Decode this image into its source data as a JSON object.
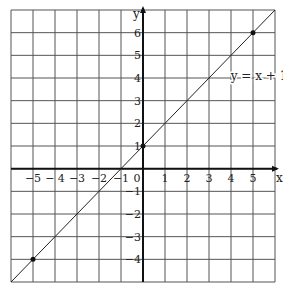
{
  "chart_data": {
    "type": "line",
    "title": "",
    "xlabel": "x",
    "ylabel": "y",
    "xlim": [
      -6,
      6
    ],
    "ylim": [
      -5,
      7
    ],
    "grid": true,
    "x_ticks": [
      -5,
      -4,
      -3,
      -2,
      -1,
      0,
      1,
      2,
      3,
      4,
      5
    ],
    "y_ticks": [
      -4,
      -3,
      -2,
      -1,
      1,
      2,
      3,
      4,
      5,
      6
    ],
    "x_tick_labels": [
      "−5",
      "− 4",
      "−3",
      "−2",
      "−1",
      "0",
      "1",
      "2",
      "3",
      "4",
      "5"
    ],
    "y_tick_labels": [
      "−4",
      "−3",
      "−2",
      "−1",
      "1",
      "2",
      "3",
      "4",
      "5",
      "6"
    ],
    "series": [
      {
        "name": "y = x + 1",
        "equation": "y = x + 1",
        "x": [
          -6,
          6
        ],
        "y": [
          -5,
          7
        ]
      }
    ],
    "marked_points": [
      {
        "x": -5,
        "y": -4
      },
      {
        "x": 0,
        "y": 1
      },
      {
        "x": 5,
        "y": 6
      }
    ],
    "annotations": [
      {
        "text": "y = x + 1",
        "x": 5.0,
        "y": 4.0
      }
    ]
  }
}
